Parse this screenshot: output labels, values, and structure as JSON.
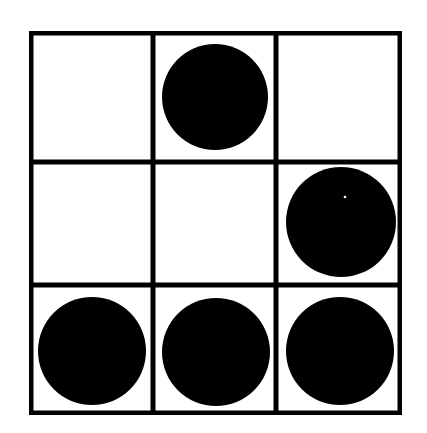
{
  "figure": {
    "type": "shape-grid",
    "canvas": {
      "width": 427,
      "height": 433,
      "background_color": "#ffffff"
    },
    "grid": {
      "rows": 3,
      "columns": 3,
      "x": 29,
      "y": 31,
      "width": 373,
      "height": 384,
      "border_color": "#000000",
      "border_width": 4,
      "cell_fill_color": "#ffffff",
      "vertical_line_x": [
        153,
        276
      ],
      "horizontal_line_y": [
        162,
        285
      ],
      "line_color": "#000000",
      "line_width": 4
    },
    "shape_color": "#000000",
    "shape_type": "circle",
    "shape_count": 5,
    "empty_cell_count": 4,
    "cells": [
      {
        "row": 0,
        "column": 0,
        "filled": false,
        "label": "cell-r0-c0"
      },
      {
        "row": 0,
        "column": 1,
        "filled": true,
        "label": "cell-r0-c1"
      },
      {
        "row": 0,
        "column": 2,
        "filled": false,
        "label": "cell-r0-c2"
      },
      {
        "row": 1,
        "column": 0,
        "filled": false,
        "label": "cell-r1-c0"
      },
      {
        "row": 1,
        "column": 1,
        "filled": false,
        "label": "cell-r1-c1"
      },
      {
        "row": 1,
        "column": 2,
        "filled": true,
        "label": "cell-r1-c2"
      },
      {
        "row": 2,
        "column": 0,
        "filled": true,
        "label": "cell-r2-c0"
      },
      {
        "row": 2,
        "column": 1,
        "filled": true,
        "label": "cell-r2-c1"
      },
      {
        "row": 2,
        "column": 2,
        "filled": true,
        "label": "cell-r2-c2"
      }
    ],
    "circles": [
      {
        "id": "circle-r0-c1",
        "row": 0,
        "column": 1,
        "cx": 215,
        "cy": 97,
        "r": 53
      },
      {
        "id": "circle-r1-c2",
        "row": 1,
        "column": 2,
        "cx": 341,
        "cy": 222,
        "r": 55
      },
      {
        "id": "circle-r2-c0",
        "row": 2,
        "column": 0,
        "cx": 92,
        "cy": 351,
        "r": 54
      },
      {
        "id": "circle-r2-c1",
        "row": 2,
        "column": 1,
        "cx": 216,
        "cy": 352,
        "r": 54
      },
      {
        "id": "circle-r2-c2",
        "row": 2,
        "column": 2,
        "cx": 340,
        "cy": 351,
        "r": 54
      }
    ],
    "speck": {
      "cx": 345,
      "cy": 197,
      "r": 1.3,
      "color": "#ffffff"
    }
  }
}
